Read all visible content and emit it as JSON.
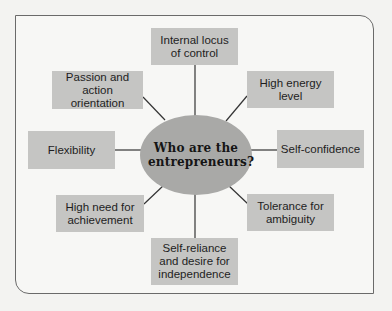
{
  "diagram": {
    "center": {
      "label": "Who are the entrepreneurs?"
    },
    "nodes": [
      {
        "id": "internal-locus",
        "label": "Internal locus of control"
      },
      {
        "id": "high-energy",
        "label": "High energy level"
      },
      {
        "id": "self-confidence",
        "label": "Self-confidence"
      },
      {
        "id": "tolerance-ambiguity",
        "label": "Tolerance for ambiguity"
      },
      {
        "id": "self-reliance",
        "label": "Self-reliance and desire for independence"
      },
      {
        "id": "need-achievement",
        "label": "High need for achievement"
      },
      {
        "id": "flexibility",
        "label": "Flexibility"
      },
      {
        "id": "passion-action",
        "label": "Passion and action orientation"
      }
    ],
    "colors": {
      "box_fill": "#c5c5c3",
      "hub_fill": "#a9a9a7",
      "line": "#333333",
      "background": "#f7f7f5"
    }
  }
}
